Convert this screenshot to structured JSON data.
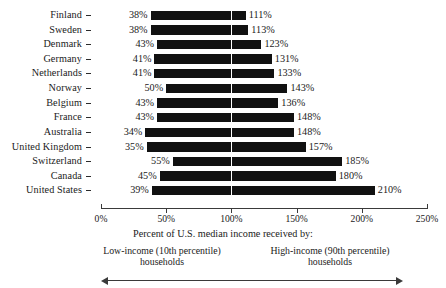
{
  "chart_data": {
    "type": "bar",
    "orientation": "horizontal",
    "title": "",
    "subtitle": "",
    "xlabel": "Percent of U.S. median income received by:",
    "ylabel": "",
    "xlim": [
      0,
      250
    ],
    "xticks": [
      0,
      50,
      100,
      150,
      200,
      250
    ],
    "xtick_labels": [
      "0%",
      "50%",
      "100%",
      "150%",
      "200%",
      "250%"
    ],
    "grid": false,
    "reference_line": {
      "value": 100,
      "label": "100%",
      "color": "#ffffff"
    },
    "legend": "none",
    "unit": "%",
    "categories": [
      "Finland",
      "Sweden",
      "Denmark",
      "Germany",
      "Netherlands",
      "Norway",
      "Belgium",
      "France",
      "Australia",
      "United Kingdom",
      "Switzerland",
      "Canada",
      "United States"
    ],
    "series": [
      {
        "name": "Low-income (10th percentile) households",
        "values": [
          38,
          38,
          43,
          41,
          41,
          50,
          43,
          43,
          34,
          35,
          55,
          45,
          39
        ],
        "labels": [
          "38%",
          "38%",
          "43%",
          "41%",
          "41%",
          "50%",
          "43%",
          "43%",
          "34%",
          "35%",
          "55%",
          "45%",
          "39%"
        ]
      },
      {
        "name": "High-income (90th percentile) households",
        "values": [
          111,
          113,
          123,
          131,
          133,
          143,
          136,
          148,
          148,
          157,
          185,
          180,
          210
        ],
        "labels": [
          "111%",
          "113%",
          "123%",
          "131%",
          "133%",
          "143%",
          "136%",
          "148%",
          "148%",
          "157%",
          "185%",
          "180%",
          "210%"
        ]
      }
    ],
    "bar_color": "#111111",
    "annotations": {
      "left_label_line1": "Low-income (10th percentile)",
      "left_label_line2": "households",
      "right_label_line1": "High-income (90th percentile)",
      "right_label_line2": "households",
      "arrow": "double-headed"
    }
  },
  "caption": "Percent of U.S. median income received by:"
}
